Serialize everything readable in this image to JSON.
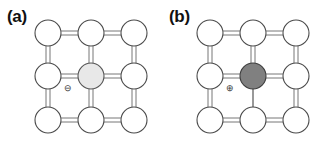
{
  "figure": {
    "width": 323,
    "height": 141,
    "background": "#ffffff",
    "type": "scientific-diagram"
  },
  "panels": [
    {
      "id": "a",
      "label": "(a)",
      "center_atom": {
        "name": "center-atom",
        "fill": "#e8e8e8",
        "stroke": "#555555",
        "shade": "light-gray"
      },
      "charge": {
        "symbol": "⊖",
        "name": "negative-charge-symbol",
        "sign": "negative",
        "color": "#3a3a3a"
      },
      "lattice": {
        "rows": 3,
        "cols": 3,
        "atom_fill": "#ffffff",
        "atom_stroke": "#4a4a4a",
        "atom_radius": 13,
        "bond_style": "double-line",
        "bond_color": "#777777",
        "single_bonds": []
      }
    },
    {
      "id": "b",
      "label": "(b)",
      "center_atom": {
        "name": "center-atom",
        "fill": "#808080",
        "stroke": "#3d3d3d",
        "shade": "dark-gray"
      },
      "charge": {
        "symbol": "⊕",
        "name": "positive-charge-symbol",
        "sign": "positive",
        "color": "#3a3a3a"
      },
      "lattice": {
        "rows": 3,
        "cols": 3,
        "atom_fill": "#ffffff",
        "atom_stroke": "#4a4a4a",
        "atom_radius": 13,
        "bond_style": "double-line",
        "bond_color": "#777777",
        "single_bonds": [
          "center-to-bottom-center"
        ]
      }
    }
  ],
  "geometry": {
    "grid_x": [
      48,
      91,
      134
    ],
    "grid_y": [
      33,
      76,
      120
    ],
    "atom_radius": 13,
    "bond_gap": 4
  }
}
